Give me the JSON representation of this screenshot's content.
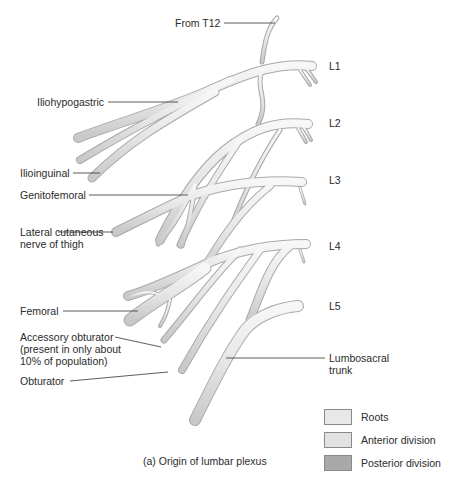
{
  "diagram": {
    "caption": "(a) Origin of lumbar plexus",
    "levels": [
      "L1",
      "L2",
      "L3",
      "L4",
      "L5"
    ],
    "labels": {
      "from_t12": "From T12",
      "iliohypogastric": "Iliohypogastric",
      "ilioinguinal": "Ilioinguinal",
      "genitofemoral": "Genitofemoral",
      "lateral_cutaneous": "Lateral cutaneous nerve of thigh",
      "femoral": "Femoral",
      "accessory_obturator": "Accessory obturator (present in only about 10% of population)",
      "obturator": "Obturator",
      "lumbosacral_trunk": "Lumbosacral trunk"
    },
    "legend": [
      {
        "label": "Roots",
        "color": "#e8e8e8"
      },
      {
        "label": "Anterior division",
        "color": "#e2e2e2"
      },
      {
        "label": "Posterior division",
        "color": "#a9a9a9"
      }
    ],
    "colors": {
      "nerve_fill": "#e9e9e9",
      "nerve_edge": "#a8a8a8",
      "leader_line": "#333333"
    }
  }
}
